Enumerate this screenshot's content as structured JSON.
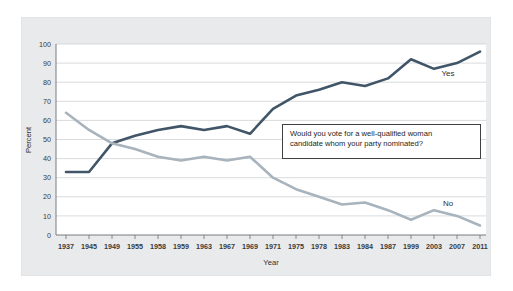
{
  "chart_data": {
    "type": "line",
    "title": "",
    "xlabel": "Year",
    "ylabel": "Percent",
    "ylim": [
      0,
      100
    ],
    "ytick_values": [
      0,
      10,
      20,
      30,
      40,
      50,
      60,
      70,
      80,
      90,
      100
    ],
    "grid": true,
    "legend_position": "inline-end-of-series",
    "categories": [
      "1937",
      "1945",
      "1949",
      "1955",
      "1958",
      "1959",
      "1963",
      "1967",
      "1969",
      "1971",
      "1975",
      "1978",
      "1983",
      "1984",
      "1987",
      "1999",
      "2003",
      "2007",
      "2011"
    ],
    "series": [
      {
        "name": "Yes",
        "color": "#415568",
        "values": [
          33,
          33,
          48,
          52,
          55,
          57,
          55,
          57,
          53,
          66,
          73,
          76,
          80,
          78,
          82,
          92,
          87,
          90,
          96
        ]
      },
      {
        "name": "No",
        "color": "#a7b3bd",
        "values": [
          64,
          55,
          48,
          45,
          41,
          39,
          41,
          39,
          41,
          30,
          24,
          20,
          16,
          17,
          13,
          8,
          13,
          10,
          5
        ]
      }
    ],
    "annotations": [
      {
        "name": "question-callout",
        "text": "Would you vote for a well-qualified woman\ncandidate whom your party nominated?"
      }
    ]
  },
  "axes": {
    "y_title": "Percent",
    "x_title": "Year"
  },
  "colors": {
    "yes_line": "#415568",
    "no_line": "#a7b3bd",
    "panel_background": "#e9eaec",
    "plot_background": "#ffffff",
    "gridline": "#c9cbcd",
    "axis": "#6b6e71",
    "callout_border": "#404040",
    "text": "#2f2f2f"
  }
}
